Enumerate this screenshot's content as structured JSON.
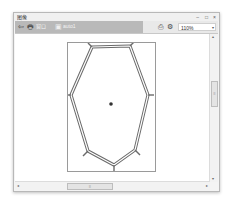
{
  "window": {
    "title": "图像",
    "controls": {
      "minimize": "–",
      "maximize": "□",
      "close": "×"
    }
  },
  "toolbar": {
    "back_icon": "⇦",
    "print_icon": "🖶",
    "tab_label": "窗口",
    "doc_icon": "▣",
    "doc_label": "auto1",
    "right_icons": [
      "print-icon",
      "settings-icon"
    ],
    "right_icon_glyphs": [
      "⎙",
      "⚙"
    ],
    "zoom_value": "110%",
    "zoom_caret": "▾"
  },
  "canvas": {
    "page": {
      "width": 87,
      "height": 128
    },
    "drawing": {
      "shape": "cell-polygon",
      "stroke_color": "#6a6a6a",
      "center_dot_color": "#333333"
    }
  },
  "scrollbars": {
    "vertical": {
      "up": "▴",
      "down": "▾",
      "thumb_grip": "≡"
    },
    "horizontal": {
      "left": "◂",
      "right": "▸",
      "thumb_grip": "≡"
    }
  }
}
